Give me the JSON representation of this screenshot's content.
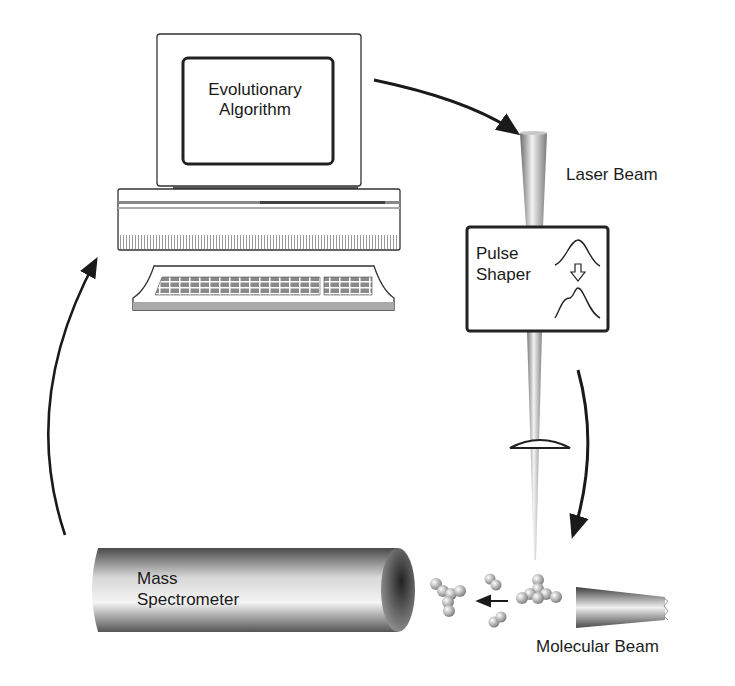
{
  "diagram": {
    "type": "closed-loop feedback control schematic",
    "components": {
      "computer": {
        "screen_label_line1": "Evolutionary",
        "screen_label_line2": "Algorithm"
      },
      "laser": {
        "label": "Laser Beam"
      },
      "pulse_shaper": {
        "label_line1": "Pulse",
        "label_line2": "Shaper",
        "icon": "pulse-reshaping-icon"
      },
      "lens": {
        "icon": "focusing-lens-icon"
      },
      "molecular_beam": {
        "label": "Molecular Beam"
      },
      "mass_spectrometer": {
        "label_line1": "Mass",
        "label_line2": "Spectrometer"
      }
    },
    "arrows": [
      {
        "from": "computer",
        "to": "laser"
      },
      {
        "from": "pulse_shaper",
        "to": "molecular_beam"
      },
      {
        "from": "molecules",
        "to": "mass_spectrometer"
      },
      {
        "from": "mass_spectrometer",
        "to": "computer"
      }
    ],
    "colors": {
      "line": "#1a1a1a",
      "metal_dark": "#5a5a5a",
      "metal_light": "#e8e8e8",
      "background": "#ffffff"
    }
  }
}
